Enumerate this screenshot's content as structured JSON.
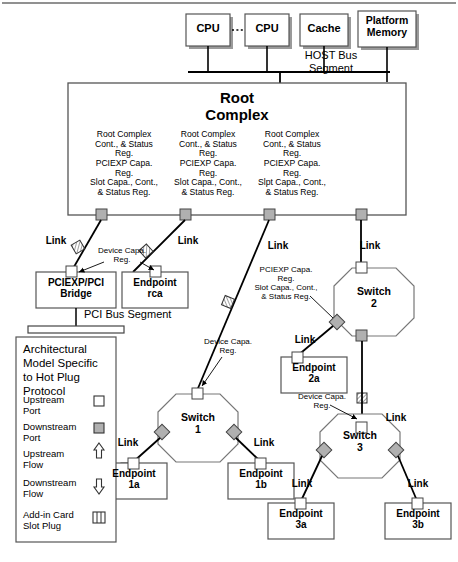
{
  "diagram": {
    "host": {
      "cpu1": "CPU",
      "cpu2": "CPU",
      "cache": "Cache",
      "platform_memory": "Platform\nMemory",
      "bus_label_line1": "HOST Bus",
      "bus_label_line2": "Segment",
      "ellipsis": "······"
    },
    "root_complex": {
      "title_line1": "Root",
      "title_line2": "Complex",
      "register_blocks": [
        "Root Complex\nCont., & Status\nReg.\nPCIEXP Capa.\nReg.\nSlot Capa., Cont.,\n& Status Reg.",
        "Root Complex\nCont., & Status\nReg.\nPCIEXP Capa.\nReg.\nSlot Capa., Cont.,\n& Status Reg.",
        "Root Complex\nCont., & Status\nReg.\nPCIEXP Capa.\nReg.\nSlpt Capa., Cont.,\n& Status Reg."
      ]
    },
    "links": {
      "label": "Link",
      "count": 11
    },
    "callouts": {
      "device_capa": "Device Capa.\nReg.",
      "switch_regs": "PCIEXP Capa.\nReg.\nSlot Capa., Cont.,\n& Status Reg."
    },
    "nodes": {
      "bridge": "PCIEXP/PCI\nBridge",
      "endpoint_rca": "Endpoint\nrca",
      "pci_bus_segment": "PCI Bus Segment",
      "switch1": "Switch\n1",
      "switch2": "Switch\n2",
      "switch3": "Switch\n3",
      "endpoint_1a": "Endpoint\n1a",
      "endpoint_1b": "Endpoint\n1b",
      "endpoint_2a": "Endpoint\n2a",
      "endpoint_3a": "Endpoint\n3a",
      "endpoint_3b": "Endpoint\n3b"
    },
    "legend": {
      "title": "Architectural\nModel Specific\nto Hot Plug\nProtocol",
      "items": [
        {
          "label": "Upstream\nPort",
          "symbol": "upstream-port-square"
        },
        {
          "label": "Downstream\nPort",
          "symbol": "downstream-port-square"
        },
        {
          "label": "Upstream\nFlow",
          "symbol": "upstream-flow-arrow"
        },
        {
          "label": "Downstream\nFlow",
          "symbol": "downstream-flow-arrow"
        },
        {
          "label": "Add-in Card\nSlot Plug",
          "symbol": "slot-plug"
        }
      ]
    },
    "colors": {
      "line": "#000000",
      "box_stroke": "#555555",
      "shadow": "#9a9a9a",
      "downstream_port_fill": "#b0b0b0",
      "upstream_port_fill": "#ffffff",
      "background": "#ffffff"
    }
  }
}
